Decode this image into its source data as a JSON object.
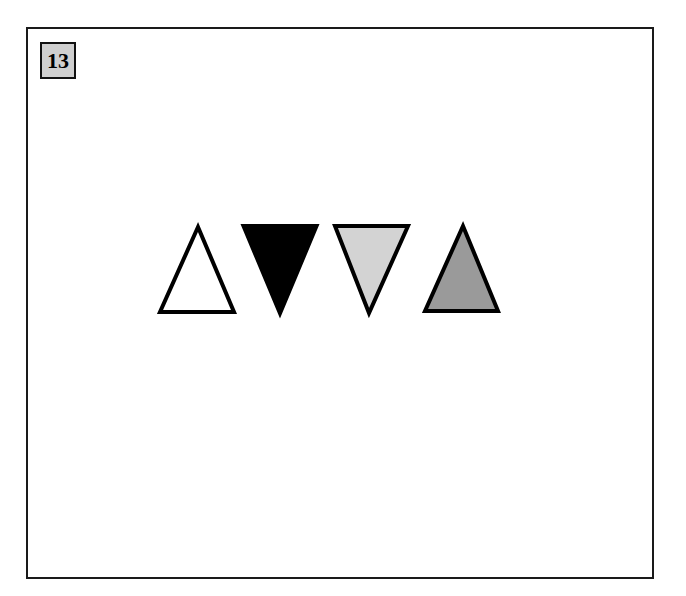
{
  "item": {
    "number": "13"
  },
  "shapes": [
    {
      "type": "triangle",
      "orientation": "up",
      "fill": "#ffffff",
      "stroke": "#000000"
    },
    {
      "type": "triangle",
      "orientation": "down",
      "fill": "#000000",
      "stroke": "#000000"
    },
    {
      "type": "triangle",
      "orientation": "down",
      "fill": "#d3d3d3",
      "stroke": "#000000"
    },
    {
      "type": "triangle",
      "orientation": "up",
      "fill": "#9a9a9a",
      "stroke": "#000000"
    }
  ]
}
